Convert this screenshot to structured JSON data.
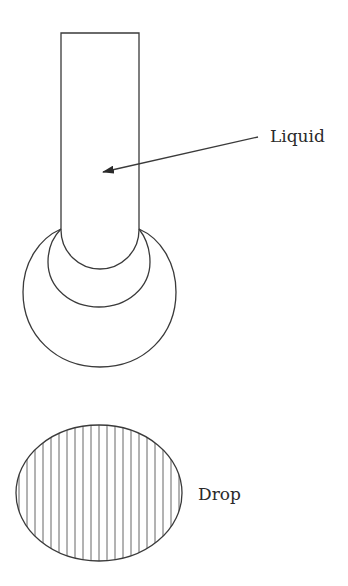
{
  "diagram": {
    "labels": {
      "liquid": "Liquid",
      "drop": "Drop"
    },
    "tube": {
      "left": 61,
      "right": 139,
      "top": 33,
      "bottom": 230,
      "meniscus_depth": 39
    },
    "meniscus_arcs": [
      {
        "name": "middle-arc",
        "left": 48,
        "right": 150,
        "top": 230,
        "bottom": 307
      },
      {
        "name": "outer-circle",
        "left": 23,
        "right": 176,
        "top": 230,
        "bottom": 367
      }
    ],
    "arrow": {
      "from": [
        258,
        137
      ],
      "to": [
        102,
        172
      ]
    },
    "drop": {
      "cx": 99,
      "cy": 493,
      "rx": 83,
      "ry": 68,
      "hatch": "vertical",
      "hatch_spacing": 8
    },
    "colors": {
      "line": "#3a3a3a",
      "background": "#ffffff"
    }
  }
}
